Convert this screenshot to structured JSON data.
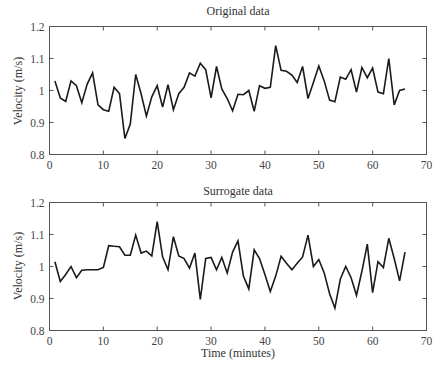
{
  "chart_data": [
    {
      "type": "line",
      "title": "Original data",
      "xlabel": "",
      "ylabel": "Velocity (m/s)",
      "xlim": [
        0,
        70
      ],
      "ylim": [
        0.8,
        1.2
      ],
      "xticks": [
        "0",
        "10",
        "20",
        "30",
        "40",
        "50",
        "60",
        "70"
      ],
      "yticks": [
        "0.8",
        "0.9",
        "1",
        "1.1",
        "1.2"
      ],
      "grid": false,
      "legend": null,
      "x": [
        1,
        2,
        3,
        4,
        5,
        6,
        7,
        8,
        9,
        10,
        11,
        12,
        13,
        14,
        15,
        16,
        17,
        18,
        19,
        20,
        21,
        22,
        23,
        24,
        25,
        26,
        27,
        28,
        29,
        30,
        31,
        32,
        33,
        34,
        35,
        36,
        37,
        38,
        39,
        40,
        41,
        42,
        43,
        44,
        45,
        46,
        47,
        48,
        49,
        50,
        51,
        52,
        53,
        54,
        55,
        56,
        57,
        58,
        59,
        60,
        61,
        62,
        63,
        64,
        65,
        66
      ],
      "series": [
        {
          "name": "Original data",
          "values": [
            1.03,
            0.977,
            0.966,
            1.03,
            1.015,
            0.962,
            1.02,
            1.055,
            0.955,
            0.94,
            0.935,
            1.01,
            0.99,
            0.85,
            0.895,
            1.05,
            0.99,
            0.92,
            0.98,
            1.015,
            0.948,
            1.018,
            0.94,
            0.99,
            1.01,
            1.055,
            1.045,
            1.085,
            1.065,
            0.977,
            1.075,
            1.005,
            0.975,
            0.937,
            0.988,
            0.987,
            1.0,
            0.935,
            1.015,
            1.007,
            1.01,
            1.14,
            1.063,
            1.06,
            1.048,
            1.025,
            1.075,
            0.975,
            1.025,
            1.077,
            1.03,
            0.97,
            0.965,
            1.042,
            1.035,
            1.065,
            0.995,
            1.072,
            1.04,
            1.07,
            0.995,
            0.99,
            1.1,
            0.955,
            1.0,
            1.005
          ]
        }
      ]
    },
    {
      "type": "line",
      "title": "Surrogate data",
      "xlabel": "Time (minutes)",
      "ylabel": "Velocity (m/s)",
      "xlim": [
        0,
        70
      ],
      "ylim": [
        0.8,
        1.2
      ],
      "xticks": [
        "0",
        "10",
        "20",
        "30",
        "40",
        "50",
        "60",
        "70"
      ],
      "yticks": [
        "0.8",
        "0.9",
        "1",
        "1.1",
        "1.2"
      ],
      "grid": false,
      "legend": null,
      "x": [
        1,
        2,
        3,
        4,
        5,
        6,
        7,
        8,
        9,
        10,
        11,
        12,
        13,
        14,
        15,
        16,
        17,
        18,
        19,
        20,
        21,
        22,
        23,
        24,
        25,
        26,
        27,
        28,
        29,
        30,
        31,
        32,
        33,
        34,
        35,
        36,
        37,
        38,
        39,
        40,
        41,
        42,
        43,
        44,
        45,
        46,
        47,
        48,
        49,
        50,
        51,
        52,
        53,
        54,
        55,
        56,
        57,
        58,
        59,
        60,
        61,
        62,
        63,
        64,
        65,
        66
      ],
      "series": [
        {
          "name": "Surrogate data",
          "values": [
            1.015,
            0.953,
            0.975,
            1.0,
            0.965,
            0.988,
            0.99,
            0.99,
            0.99,
            0.997,
            1.065,
            1.063,
            1.062,
            1.035,
            1.035,
            1.098,
            1.042,
            1.048,
            1.033,
            1.14,
            1.03,
            0.99,
            1.093,
            1.033,
            1.025,
            0.995,
            1.042,
            0.897,
            1.025,
            1.028,
            0.99,
            1.028,
            0.98,
            1.045,
            1.08,
            0.97,
            0.93,
            1.052,
            1.025,
            0.975,
            0.922,
            0.97,
            1.032,
            1.01,
            0.99,
            1.01,
            1.03,
            1.098,
            1.0,
            1.022,
            0.98,
            0.915,
            0.87,
            0.96,
            1.0,
            0.965,
            0.91,
            0.985,
            1.07,
            0.918,
            1.015,
            0.997,
            1.088,
            1.025,
            0.955,
            1.045
          ]
        }
      ]
    }
  ],
  "panels": [
    {
      "title": "Original data",
      "ylabel": "Velocity (m/s)",
      "xlabel": ""
    },
    {
      "title": "Surrogate data",
      "ylabel": "Velocity (m/s)",
      "xlabel": "Time (minutes)"
    }
  ]
}
